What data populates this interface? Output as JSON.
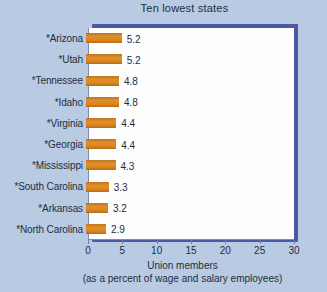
{
  "chart_data": {
    "type": "bar",
    "orientation": "horizontal",
    "title": "Ten lowest states",
    "xlabel_line1": "Union members",
    "xlabel_line2": "(as a percent of wage and salary employees)",
    "ylabel": "",
    "categories": [
      "*Arizona",
      "*Utah",
      "*Tennessee",
      "*Idaho",
      "*Virginia",
      "*Georgia",
      "*Mississippi",
      "*South Carolina",
      "*Arkansas",
      "*North Carolina"
    ],
    "values": [
      5.2,
      5.2,
      4.8,
      4.8,
      4.4,
      4.4,
      4.3,
      3.3,
      3.2,
      2.9
    ],
    "value_labels": [
      "5.2",
      "5.2",
      "4.8",
      "4.8",
      "4.4",
      "4.4",
      "4.3",
      "3.3",
      "3.2",
      "2.9"
    ],
    "xlim": [
      0,
      30
    ],
    "xticks": [
      0,
      5,
      10,
      15,
      20,
      25,
      30
    ],
    "xtick_labels": [
      "0",
      "5",
      "10",
      "15",
      "20",
      "25",
      "30"
    ],
    "grid": false,
    "legend": null,
    "colors": {
      "background": "#b9cbe2",
      "plot_background": "#fdfdfd",
      "bar": "#d9861f",
      "frame_shadow": "#4d57a4",
      "text": "#1d2d3e",
      "axis_line": "#7b8db0"
    }
  }
}
